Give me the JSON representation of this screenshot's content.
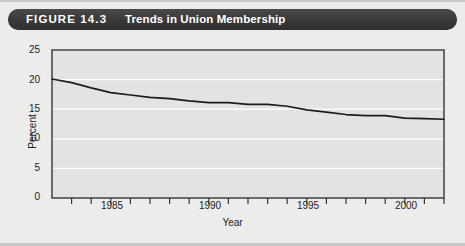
{
  "figure": {
    "number_label": "FIGURE 14.3",
    "title": "Trends in Union Membership",
    "titlebar_color": "#3b3b3b",
    "panel_color": "#e3e3e1",
    "page_background": "#ececeb",
    "line_color": "#1c1c1c",
    "gridline_color": "#ffffff"
  },
  "chart_data": {
    "type": "line",
    "title": "Trends in Union Membership",
    "xlabel": "Year",
    "ylabel": "Percent",
    "xlim": [
      1982,
      2002
    ],
    "ylim": [
      0,
      25
    ],
    "ytick_labels": [
      "0",
      "5",
      "10",
      "15",
      "20",
      "25"
    ],
    "yticks": [
      0,
      5,
      10,
      15,
      20,
      25
    ],
    "xtick_labels": [
      "1985",
      "1990",
      "1995",
      "2000"
    ],
    "xticks_labeled": [
      1985,
      1990,
      1995,
      2000
    ],
    "xticks_all": [
      1982,
      1983,
      1984,
      1985,
      1986,
      1987,
      1988,
      1989,
      1990,
      1991,
      1992,
      1993,
      1994,
      1995,
      1996,
      1997,
      1998,
      1999,
      2000,
      2001,
      2002
    ],
    "grid": "horizontal",
    "legend": "none",
    "series": [
      {
        "name": "Union membership",
        "x": [
          1982,
          1983,
          1984,
          1985,
          1986,
          1987,
          1988,
          1989,
          1990,
          1991,
          1992,
          1993,
          1994,
          1995,
          1996,
          1997,
          1998,
          1999,
          2000,
          2001,
          2002
        ],
        "values": [
          20.1,
          19.5,
          18.6,
          17.8,
          17.4,
          17.0,
          16.8,
          16.4,
          16.1,
          16.1,
          15.8,
          15.8,
          15.5,
          14.9,
          14.5,
          14.1,
          13.9,
          13.9,
          13.5,
          13.4,
          13.3
        ]
      }
    ]
  }
}
